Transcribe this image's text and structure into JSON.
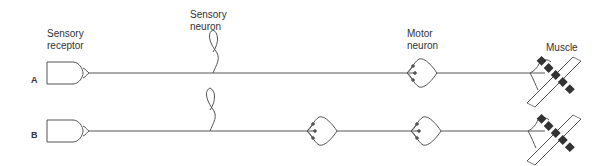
{
  "labels": {
    "sensory_receptor": [
      "Sensory",
      "receptor"
    ],
    "sensory_neuron": [
      "Sensory",
      "neuron"
    ],
    "motor_neuron": [
      "Motor",
      "neuron"
    ],
    "muscle": "Muscle"
  },
  "rows": [
    {
      "id": "A",
      "label": "A",
      "interneurons": 0
    },
    {
      "id": "B",
      "label": "B",
      "interneurons": 1
    }
  ],
  "colors": {
    "stroke": "#555555",
    "text": "#333333",
    "background": "#ffffff"
  }
}
